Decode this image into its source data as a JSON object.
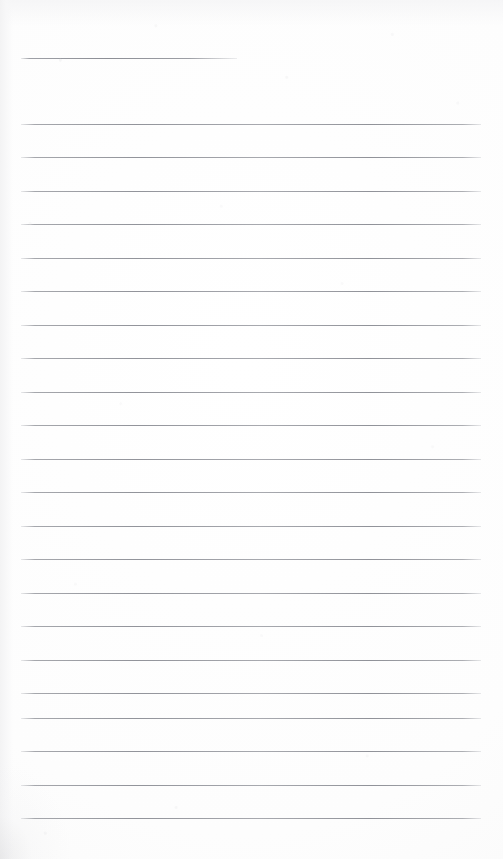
{
  "document": {
    "kind": "scanned-lined-notebook-page",
    "title": "Blank lined notebook page",
    "content_text": "",
    "page_width_px": 503,
    "page_height_px": 859,
    "background_color": "#fdfdfd",
    "rule_color": "#8c8e95",
    "rule_thickness_px": 1,
    "rule_left_x_px": 21,
    "rule_right_x_px": 481,
    "rule_spacing_px": 33.5,
    "rule_count": 23,
    "first_rule_is_short": true,
    "first_rule_right_x_px": 237,
    "skipped_rule_y_px": 91
  },
  "rules": [
    {
      "name": "rule-1",
      "y": 58,
      "x1": 21,
      "x2": 237,
      "short": true
    },
    {
      "name": "rule-2",
      "y": 124,
      "x1": 21,
      "x2": 481,
      "short": false
    },
    {
      "name": "rule-3",
      "y": 157,
      "x1": 21,
      "x2": 481,
      "short": false
    },
    {
      "name": "rule-4",
      "y": 191,
      "x1": 21,
      "x2": 481,
      "short": false
    },
    {
      "name": "rule-5",
      "y": 224,
      "x1": 21,
      "x2": 481,
      "short": false
    },
    {
      "name": "rule-6",
      "y": 258,
      "x1": 21,
      "x2": 481,
      "short": false
    },
    {
      "name": "rule-7",
      "y": 291,
      "x1": 21,
      "x2": 481,
      "short": false
    },
    {
      "name": "rule-8",
      "y": 325,
      "x1": 21,
      "x2": 481,
      "short": false
    },
    {
      "name": "rule-9",
      "y": 358,
      "x1": 21,
      "x2": 481,
      "short": false
    },
    {
      "name": "rule-10",
      "y": 392,
      "x1": 21,
      "x2": 481,
      "short": false
    },
    {
      "name": "rule-11",
      "y": 425,
      "x1": 21,
      "x2": 481,
      "short": false
    },
    {
      "name": "rule-12",
      "y": 459,
      "x1": 21,
      "x2": 481,
      "short": false
    },
    {
      "name": "rule-13",
      "y": 492,
      "x1": 21,
      "x2": 481,
      "short": false
    },
    {
      "name": "rule-14",
      "y": 526,
      "x1": 21,
      "x2": 481,
      "short": false
    },
    {
      "name": "rule-15",
      "y": 559,
      "x1": 21,
      "x2": 481,
      "short": false
    },
    {
      "name": "rule-16",
      "y": 593,
      "x1": 21,
      "x2": 481,
      "short": false
    },
    {
      "name": "rule-17",
      "y": 626,
      "x1": 21,
      "x2": 481,
      "short": false
    },
    {
      "name": "rule-18",
      "y": 660,
      "x1": 21,
      "x2": 481,
      "short": false
    },
    {
      "name": "rule-19",
      "y": 693,
      "x1": 21,
      "x2": 481,
      "short": false
    },
    {
      "name": "rule-20",
      "y": 718,
      "x1": 21,
      "x2": 481,
      "short": false
    },
    {
      "name": "rule-21",
      "y": 751,
      "x1": 21,
      "x2": 481,
      "short": false
    },
    {
      "name": "rule-22",
      "y": 785,
      "x1": 21,
      "x2": 481,
      "short": false
    },
    {
      "name": "rule-23",
      "y": 818,
      "x1": 21,
      "x2": 481,
      "short": false
    }
  ]
}
